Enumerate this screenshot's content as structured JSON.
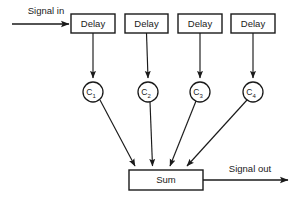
{
  "diagram": {
    "background_color": "#ffffff",
    "line_color": "#1a1a1a",
    "input": {
      "label": "Signal in",
      "arrow_from_x": 12,
      "arrow_to_x": 71,
      "arrow_y": 24
    },
    "output": {
      "label": "Signal out",
      "arrow_from_x": 203,
      "arrow_to_x": 290,
      "arrow_y": 180
    },
    "delay_blocks": [
      {
        "label": "Delay",
        "x": 71,
        "y": 14,
        "w": 44,
        "h": 19,
        "cx": 93
      },
      {
        "label": "Delay",
        "x": 125,
        "y": 14,
        "w": 43,
        "h": 19,
        "cx": 146
      },
      {
        "label": "Delay",
        "x": 178,
        "y": 14,
        "w": 44,
        "h": 19,
        "cx": 200
      },
      {
        "label": "Delay",
        "x": 231,
        "y": 14,
        "w": 44,
        "h": 19,
        "cx": 253
      }
    ],
    "coefficient_nodes": [
      {
        "label": "C",
        "subscript": "1",
        "cx": 93,
        "cy": 92,
        "r": 10
      },
      {
        "label": "C",
        "subscript": "2",
        "cx": 148,
        "cy": 92,
        "r": 10
      },
      {
        "label": "C",
        "subscript": "3",
        "cx": 200,
        "cy": 92,
        "r": 10
      },
      {
        "label": "C",
        "subscript": "4",
        "cx": 253,
        "cy": 92,
        "r": 10
      }
    ],
    "sum_block": {
      "label": "Sum",
      "x": 129,
      "y": 170,
      "w": 74,
      "h": 20,
      "cx": 166,
      "cy": 180
    },
    "sum_input_arrow_targets": [
      135,
      152,
      170,
      186
    ],
    "tap_arrows_to_nodes": [
      {
        "from_x": 93,
        "from_y": 33,
        "to_x": 93,
        "to_y": 80
      },
      {
        "from_x": 146,
        "from_y": 33,
        "to_x": 148,
        "to_y": 80
      },
      {
        "from_x": 200,
        "from_y": 33,
        "to_x": 200,
        "to_y": 80
      },
      {
        "from_x": 253,
        "from_y": 33,
        "to_x": 253,
        "to_y": 80
      }
    ],
    "node_arrows_to_sum": [
      {
        "from_x": 100,
        "from_y": 100,
        "to_x": 135,
        "to_y": 167
      },
      {
        "from_x": 150,
        "from_y": 102,
        "to_x": 152,
        "to_y": 167
      },
      {
        "from_x": 196,
        "from_y": 101,
        "to_x": 170,
        "to_y": 167
      },
      {
        "from_x": 247,
        "from_y": 100,
        "to_x": 187,
        "to_y": 167
      }
    ]
  }
}
